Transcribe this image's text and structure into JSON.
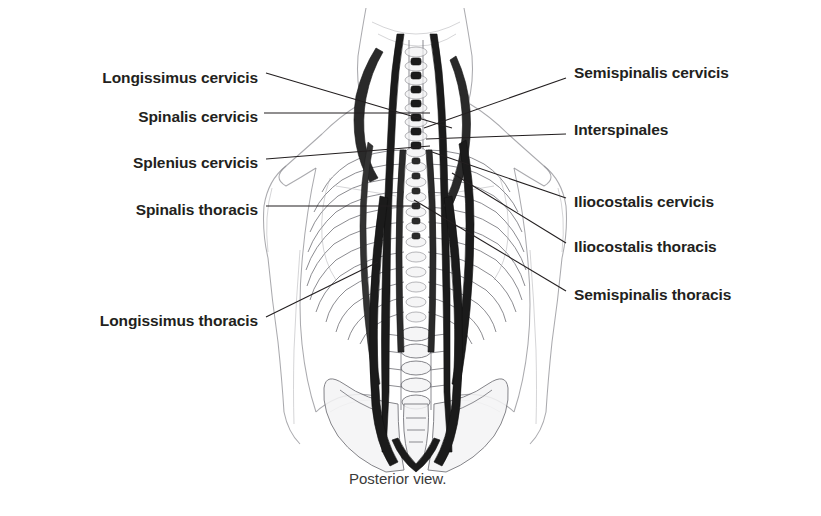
{
  "figure": {
    "caption": "Posterior view.",
    "background_color": "#ffffff",
    "ink_color": "#231f20",
    "muscle_color": "#1b1b1b",
    "bone_color": "#f4f4f5",
    "skin_outline_color": "#8e8e93"
  },
  "labels_left": [
    {
      "id": "longissimus-cervicis",
      "text": "Longissimus cervicis",
      "text_x": 258,
      "text_y": 78,
      "leader": [
        [
          266,
          73
        ],
        [
          452,
          128
        ]
      ]
    },
    {
      "id": "spinalis-cervicis",
      "text": "Spinalis cervicis",
      "text_x": 258,
      "text_y": 117,
      "leader": [
        [
          264,
          113
        ],
        [
          430,
          113
        ]
      ]
    },
    {
      "id": "splenius-cervicis",
      "text": "Splenius cervicis",
      "text_x": 258,
      "text_y": 163,
      "leader": [
        [
          266,
          159
        ],
        [
          430,
          146
        ]
      ]
    },
    {
      "id": "spinalis-thoracis",
      "text": "Spinalis thoracis",
      "text_x": 258,
      "text_y": 210,
      "leader": [
        [
          266,
          206
        ],
        [
          418,
          206
        ]
      ]
    },
    {
      "id": "longissimus-thoracis",
      "text": "Longissimus thoracis",
      "text_x": 258,
      "text_y": 322,
      "leader": [
        [
          266,
          317
        ],
        [
          378,
          262
        ]
      ]
    }
  ],
  "labels_right": [
    {
      "id": "semispinalis-cervicis",
      "text": "Semispinalis cervicis",
      "text_x": 574,
      "text_y": 73,
      "leader": [
        [
          566,
          78
        ],
        [
          424,
          128
        ]
      ]
    },
    {
      "id": "interspinales",
      "text": "Interspinales",
      "text_x": 574,
      "text_y": 130,
      "leader": [
        [
          566,
          134
        ],
        [
          426,
          139
        ]
      ]
    },
    {
      "id": "iliocostalis-cervicis",
      "text": "Iliocostalis cervicis",
      "text_x": 574,
      "text_y": 202,
      "leader": [
        [
          566,
          198
        ],
        [
          432,
          152
        ]
      ]
    },
    {
      "id": "iliocostalis-thoracis",
      "text": "Iliocostalis thoracis",
      "text_x": 574,
      "text_y": 247,
      "leader": [
        [
          566,
          243
        ],
        [
          452,
          173
        ]
      ]
    },
    {
      "id": "semispinalis-thoracis",
      "text": "Semispinalis thoracis",
      "text_x": 574,
      "text_y": 295,
      "leader": [
        [
          566,
          291
        ],
        [
          414,
          200
        ]
      ]
    }
  ],
  "caption_position": {
    "x": 349,
    "y": 478
  },
  "anatomy_parts": [
    "skull-base",
    "cervical-spine",
    "thoracic-spine",
    "lumbar-spine",
    "sacrum",
    "ribcage",
    "scapula-region",
    "pelvis",
    "erector-spinae-muscles"
  ],
  "rib_pair_count": 12
}
